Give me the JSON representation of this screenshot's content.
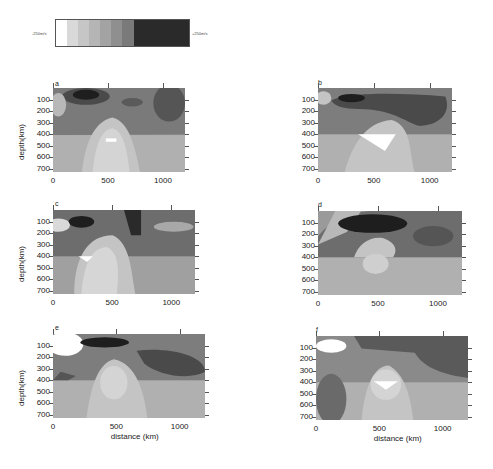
{
  "legend": {
    "min_label": "-250m/s",
    "max_label": "+250m/s",
    "colors": [
      "#ffffff",
      "#d9d9d9",
      "#c6c6c6",
      "#b5b5b5",
      "#a3a3a3",
      "#8f8f8f",
      "#7a7a7a",
      "#2a2a2a",
      "#222222",
      "#1e1e1e",
      "#1a1a1a",
      "#181818"
    ]
  },
  "axes": {
    "y_label": "depth(km)",
    "x_label": "distance (km)",
    "y_ticks": [
      "100",
      "200",
      "300",
      "400",
      "500",
      "600",
      "700"
    ],
    "x_ticks": [
      "0",
      "500",
      "1000"
    ]
  },
  "panels": [
    {
      "id": "a",
      "label": "a"
    },
    {
      "id": "b",
      "label": "b"
    },
    {
      "id": "c",
      "label": "c"
    },
    {
      "id": "d",
      "label": "d"
    },
    {
      "id": "e",
      "label": "e"
    },
    {
      "id": "f",
      "label": "f"
    }
  ],
  "chart_data": {
    "type": "heatmap",
    "title": "",
    "xlabel": "distance (km)",
    "ylabel": "depth(km)",
    "xlim": [
      0,
      1200
    ],
    "ylim": [
      700,
      0
    ],
    "x_ticks": [
      0,
      500,
      1000
    ],
    "y_ticks": [
      100,
      200,
      300,
      400,
      500,
      600,
      700
    ],
    "colorbar": {
      "min": "-250m/s",
      "max": "+250m/s",
      "levels": 12
    },
    "panels": [
      "a",
      "b",
      "c",
      "d",
      "e",
      "f"
    ]
  }
}
